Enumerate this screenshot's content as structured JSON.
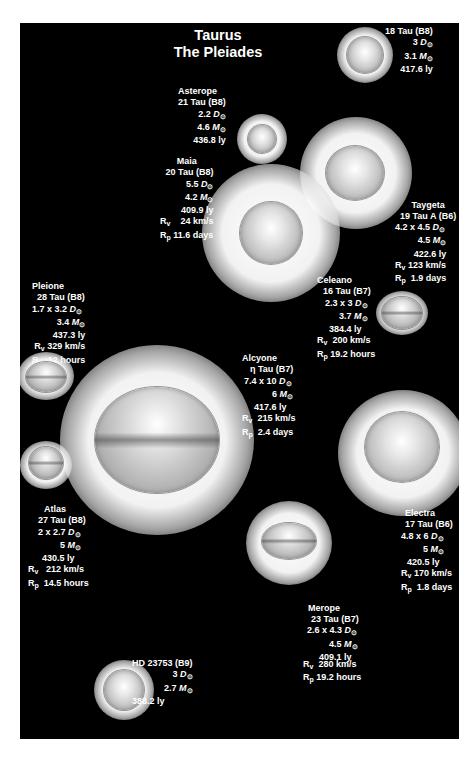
{
  "title": {
    "line1": "Taurus",
    "line2": "The Pleiades"
  },
  "colors": {
    "background": "#000000",
    "page": "#ffffff",
    "text": "#ffffff"
  },
  "symbols": {
    "sun": "⊙",
    "D": "D",
    "M": "M",
    "Rv": "R",
    "v": "v",
    "Rp": "R",
    "p": "p"
  },
  "stars": {
    "s18tau": {
      "name": "",
      "designation": "18 Tau (B8)",
      "diameter": "3",
      "mass": "3.1",
      "distance": "417.6 ly"
    },
    "asterope": {
      "name": "Asterope",
      "designation": "21 Tau (B8)",
      "diameter": "2.2",
      "mass": "4.6",
      "distance": "436.8 ly"
    },
    "maia": {
      "name": "Maia",
      "designation": "20 Tau (B8)",
      "diameter": "5.5",
      "mass": "4.2",
      "distance": "409.9 ly",
      "rv": "24 km/s",
      "rp": "11.6 days"
    },
    "taygeta": {
      "name": "Taygeta",
      "designation": "19 Tau A (B6)",
      "diameter": "4.2 x 4.5",
      "mass": "4.5",
      "distance": "422.6 ly",
      "rv": "123 km/s",
      "rp": "1.9 days"
    },
    "pleione": {
      "name": "Pleione",
      "designation": "28 Tau (B8)",
      "diameter": "1.7 x 3.2",
      "mass": "3.4",
      "distance": "437.3 ly",
      "rv": "329 km/s",
      "rp": "12 hours"
    },
    "celeano": {
      "name": "Celeano",
      "designation": "16 Tau (B7)",
      "diameter": "2.3 x 3",
      "mass": "3.7",
      "distance": "384.4 ly",
      "rv": "200 km/s",
      "rp": "19.2 hours"
    },
    "alcyone": {
      "name": "Alcyone",
      "designation": "η Tau (B7)",
      "diameter": "7.4 x 10",
      "mass": "6",
      "distance": "417.6 ly",
      "rv": "215 km/s",
      "rp": "2.4 days"
    },
    "atlas": {
      "name": "Atlas",
      "designation": "27 Tau (B8)",
      "diameter": "2 x 2.7",
      "mass": "5",
      "distance": "430.5 ly",
      "rv": "212 km/s",
      "rp": "14.5 hours"
    },
    "electra": {
      "name": "Electra",
      "designation": "17 Tau (B6)",
      "diameter": "4.8 x 6",
      "mass": "5",
      "distance": "420.5 ly",
      "rv": "170 km/s",
      "rp": "1.8 days"
    },
    "merope": {
      "name": "Merope",
      "designation": "23 Tau (B7)",
      "diameter": "2.6 x 4.3",
      "mass": "4.5",
      "distance": "409.1 ly",
      "rv": "280 km/s",
      "rp": "19.2 hours"
    },
    "hd23753": {
      "name": "",
      "designation": "HD 23753 (B9)",
      "diameter": "3",
      "mass": "2.7",
      "distance": "388.2 ly"
    }
  }
}
